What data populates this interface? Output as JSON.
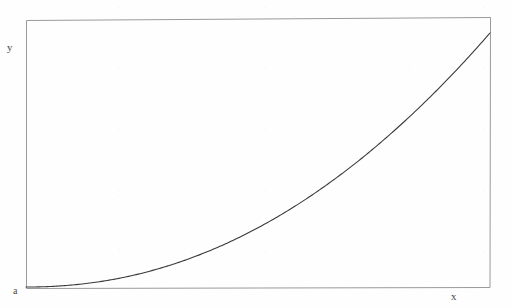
{
  "figure": {
    "width": 511,
    "height": 308,
    "background_color": "#fefefe"
  },
  "labels": {
    "y_axis": "y",
    "x_axis": "x",
    "origin": "a"
  },
  "style": {
    "frame_color": "#9a9a9a",
    "frame_width": 1,
    "curve_color": "#3a3a3a",
    "curve_width": 1.1,
    "label_color": "#4a4a4a"
  },
  "chart_data": {
    "type": "line",
    "title": "",
    "xlabel": "x",
    "ylabel": "y",
    "legend": [],
    "grid": false,
    "axis_style": "box-frame",
    "annotations": [
      {
        "text": "y",
        "position": "outside-left-top",
        "px": [
          10,
          48
        ]
      },
      {
        "text": "a",
        "position": "outside-left-bottom-origin",
        "px": [
          16,
          292
        ]
      },
      {
        "text": "x",
        "position": "outside-right-bottom",
        "px": [
          455,
          297
        ]
      }
    ],
    "frame_px": {
      "left": 26,
      "top": 20,
      "right": 490,
      "bottom": 287
    },
    "curve_fit": {
      "form": "v = t^n",
      "n": 2.1,
      "t_range": [
        0,
        1
      ],
      "v_range": [
        0,
        1
      ]
    },
    "x": [
      0.0,
      0.1,
      0.2,
      0.3,
      0.4,
      0.5,
      0.6,
      0.7,
      0.8,
      0.9,
      1.0
    ],
    "y": [
      0.0,
      0.0079,
      0.0339,
      0.0784,
      0.1426,
      0.2336,
      0.3393,
      0.4726,
      0.6286,
      0.8097,
      1.0
    ],
    "points_px": [
      [
        26,
        287
      ],
      [
        72,
        281
      ],
      [
        100,
        273
      ],
      [
        140,
        267
      ],
      [
        170,
        259
      ],
      [
        200,
        250
      ],
      [
        230,
        233
      ],
      [
        260,
        215
      ],
      [
        295,
        193
      ],
      [
        330,
        170
      ],
      [
        355,
        155
      ],
      [
        380,
        140
      ],
      [
        400,
        125
      ],
      [
        430,
        98
      ],
      [
        460,
        67
      ],
      [
        490,
        33
      ]
    ],
    "xlim": [
      0,
      1
    ],
    "ylim": [
      0,
      1
    ],
    "xticks": [],
    "yticks": []
  }
}
